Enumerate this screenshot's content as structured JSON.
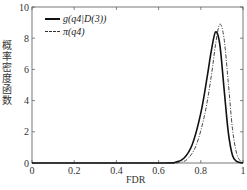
{
  "chart_data": {
    "type": "line",
    "title": "",
    "xlabel": "FDR",
    "ylabel": "概率密度函数",
    "xlim": [
      0,
      1
    ],
    "ylim": [
      0,
      10
    ],
    "xticks": [
      "0",
      "0.2",
      "0.4",
      "0.6",
      "0.8",
      "1"
    ],
    "yticks": [
      "0",
      "2",
      "4",
      "6",
      "8",
      "10"
    ],
    "grid": false,
    "legend_position": "upper-left",
    "series": [
      {
        "name": "g(q4|D(3))",
        "style": "solid",
        "x": [
          0,
          0.6,
          0.68,
          0.72,
          0.76,
          0.8,
          0.83,
          0.85,
          0.87,
          0.89,
          0.91,
          0.93,
          0.95,
          0.97,
          1.0
        ],
        "y": [
          0,
          0,
          0.05,
          0.3,
          1.2,
          3.2,
          5.5,
          7.2,
          8.4,
          7.6,
          4.8,
          2.0,
          0.5,
          0.1,
          0
        ]
      },
      {
        "name": "π(q4)",
        "style": "dash-dot",
        "x": [
          0,
          0.6,
          0.7,
          0.74,
          0.78,
          0.82,
          0.85,
          0.87,
          0.89,
          0.91,
          0.93,
          0.95,
          0.97,
          0.99,
          1.0
        ],
        "y": [
          0,
          0,
          0.05,
          0.3,
          1.2,
          3.2,
          5.6,
          7.6,
          8.9,
          8.0,
          5.2,
          2.2,
          0.6,
          0.1,
          0
        ]
      }
    ]
  },
  "legend": {
    "items": [
      {
        "label": "g(q4|D(3))"
      },
      {
        "label": "π(q4)"
      }
    ]
  },
  "axes": {
    "xlabel": "FDR",
    "ylabel": "概率密度函数"
  }
}
